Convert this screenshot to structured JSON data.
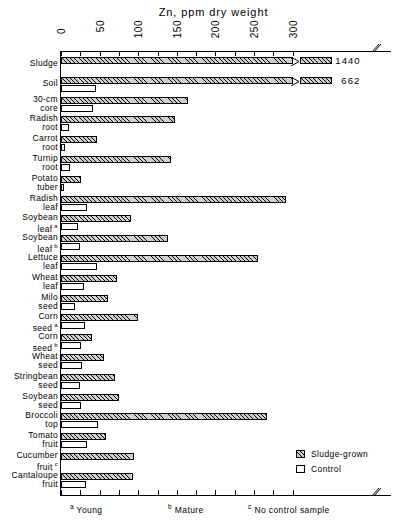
{
  "chart_data": {
    "type": "bar",
    "orientation": "horizontal",
    "title": "Zn, ppm dry weight",
    "xlabel": "Zn, ppm dry weight",
    "ylabel": "",
    "xlim": [
      0,
      310
    ],
    "axis_break": true,
    "axis_break_note": "axis broken just past 300; Sludge and Soil bars truncated with off-scale values printed",
    "grid": false,
    "xticks": [
      0,
      25,
      50,
      75,
      100,
      125,
      150,
      175,
      200,
      225,
      250,
      275,
      300
    ],
    "xticklabels_major": [
      "0",
      "50",
      "100",
      "150",
      "200",
      "250",
      "300"
    ],
    "xtickvalues_major": [
      0,
      50,
      100,
      150,
      200,
      250,
      300
    ],
    "legend": {
      "position": "bottom-right",
      "entries": [
        {
          "name": "Sludge-grown",
          "pattern": "hatched"
        },
        {
          "name": "Control",
          "pattern": "open"
        }
      ]
    },
    "categories": [
      "Sludge",
      "Soil",
      "30-cm core",
      "Radish root",
      "Carrot root",
      "Turnip root",
      "Potato tuber",
      "Radish leaf",
      "Soybean leaf a",
      "Soybean leaf b",
      "Lettuce leaf",
      "Wheat leaf",
      "Milo seed",
      "Corn seed a",
      "Corn seed b",
      "Wheat seed",
      "Stringbean seed",
      "Soybean seed",
      "Broccoli top",
      "Tomato fruit",
      "Cucumber fruit c",
      "Cantaloupe fruit"
    ],
    "series": [
      {
        "name": "Sludge-grown",
        "values": [
          1440,
          662,
          164,
          148,
          46,
          143,
          26,
          291,
          91,
          139,
          255,
          72,
          61,
          100,
          40,
          56,
          70,
          75,
          267,
          58,
          95,
          93
        ]
      },
      {
        "name": "Control",
        "values": [
          null,
          45,
          42,
          10,
          5,
          12,
          4,
          34,
          22,
          25,
          46,
          30,
          18,
          31,
          26,
          27,
          24,
          26,
          48,
          34,
          null,
          32
        ]
      }
    ],
    "offscale_labels": [
      {
        "category": "Sludge",
        "value": 1440,
        "text": "1440"
      },
      {
        "category": "Soil",
        "value": 662,
        "text": "662"
      }
    ]
  },
  "labels": {
    "rows": [
      {
        "line1": "Sludge",
        "line2": "",
        "sup": ""
      },
      {
        "line1": "Soil",
        "line2": "",
        "sup": ""
      },
      {
        "line1": "30-cm",
        "line2": "core",
        "sup": ""
      },
      {
        "line1": "Radish",
        "line2": "root",
        "sup": ""
      },
      {
        "line1": "Carrot",
        "line2": "root",
        "sup": ""
      },
      {
        "line1": "Turnip",
        "line2": "root",
        "sup": ""
      },
      {
        "line1": "Potato",
        "line2": "tuber",
        "sup": ""
      },
      {
        "line1": "Radish",
        "line2": "leaf",
        "sup": ""
      },
      {
        "line1": "Soybean",
        "line2": "leaf",
        "sup": "a"
      },
      {
        "line1": "Soybean",
        "line2": "leaf",
        "sup": "b"
      },
      {
        "line1": "Lettuce",
        "line2": "leaf",
        "sup": ""
      },
      {
        "line1": "Wheat",
        "line2": "leaf",
        "sup": ""
      },
      {
        "line1": "Milo",
        "line2": "seed",
        "sup": ""
      },
      {
        "line1": "Corn",
        "line2": "seed",
        "sup": "a"
      },
      {
        "line1": "Corn",
        "line2": "seed",
        "sup": "b"
      },
      {
        "line1": "Wheat",
        "line2": "seed",
        "sup": ""
      },
      {
        "line1": "Stringbean",
        "line2": "seed",
        "sup": ""
      },
      {
        "line1": "Soybean",
        "line2": "seed",
        "sup": ""
      },
      {
        "line1": "Broccoli",
        "line2": "top",
        "sup": ""
      },
      {
        "line1": "Tomato",
        "line2": "fruit",
        "sup": ""
      },
      {
        "line1": "Cucumber",
        "line2": "fruit",
        "sup": "c"
      },
      {
        "line1": "Cantaloupe",
        "line2": "fruit",
        "sup": ""
      }
    ]
  },
  "footnotes": [
    {
      "mark": "a",
      "text": "Young"
    },
    {
      "mark": "b",
      "text": "Mature"
    },
    {
      "mark": "c",
      "text": "No control sample"
    }
  ],
  "colors": {
    "ink": "#000000",
    "paper": "#ffffff",
    "hatch_fill": "#cfcfcf"
  }
}
